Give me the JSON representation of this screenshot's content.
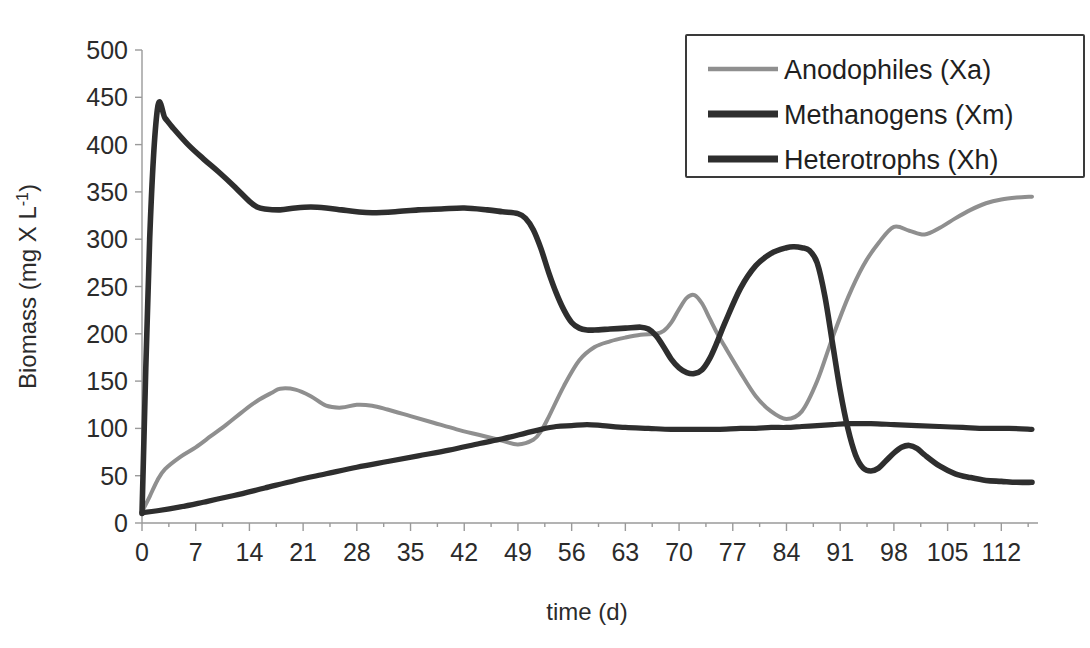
{
  "figure": {
    "top_cut_text": "",
    "background_color": "#ffffff"
  },
  "chart_data": {
    "type": "line",
    "title": "",
    "xlabel": "time (d)",
    "ylabel": "Biomass (mg X L-1)",
    "ylabel_parts": {
      "main": "Biomass (mg X L",
      "sup": "-1",
      "close": ")"
    },
    "xlim": [
      0,
      116
    ],
    "ylim": [
      0,
      500
    ],
    "xticks": [
      0,
      7,
      14,
      21,
      28,
      35,
      42,
      49,
      56,
      63,
      70,
      77,
      84,
      91,
      98,
      105,
      112
    ],
    "yticks": [
      0,
      50,
      100,
      150,
      200,
      250,
      300,
      350,
      400,
      450,
      500
    ],
    "grid": false,
    "legend_position": "top-right",
    "series": [
      {
        "name": "Anodophiles (Xa)",
        "key": "Xa",
        "color": "#8f8f8f",
        "width": 4.0,
        "x": [
          0,
          1,
          2,
          3,
          5,
          7,
          9,
          11,
          13,
          15,
          17,
          18,
          20,
          22,
          24,
          26,
          28,
          30,
          32,
          35,
          38,
          41,
          44,
          47,
          49,
          51,
          52,
          53,
          55,
          57,
          59,
          61,
          63,
          65,
          67,
          68,
          69,
          70,
          71,
          72,
          73,
          74,
          75,
          76,
          78,
          80,
          82,
          84,
          86,
          88,
          90,
          92,
          94,
          96,
          98,
          100,
          102,
          104,
          106,
          108,
          110,
          112,
          114,
          116
        ],
        "y": [
          12,
          28,
          45,
          57,
          70,
          80,
          92,
          104,
          117,
          129,
          138,
          142,
          141,
          134,
          124,
          122,
          125,
          124,
          120,
          113,
          106,
          99,
          93,
          87,
          83,
          88,
          97,
          112,
          145,
          172,
          186,
          192,
          196,
          199,
          200,
          203,
          212,
          226,
          238,
          241,
          232,
          216,
          200,
          186,
          159,
          134,
          118,
          110,
          118,
          150,
          196,
          238,
          272,
          296,
          313,
          309,
          305,
          312,
          322,
          331,
          338,
          342,
          344,
          345
        ]
      },
      {
        "name": "Methanogens (Xm)",
        "key": "Xm",
        "color": "#2e2e2e",
        "width": 5.6,
        "x": [
          0,
          1,
          2,
          3,
          4,
          6,
          8,
          10,
          12,
          14,
          15,
          16,
          18,
          20,
          22,
          24,
          26,
          28,
          30,
          33,
          36,
          39,
          42,
          45,
          47,
          49,
          50,
          51,
          52,
          53,
          54,
          55,
          56,
          57,
          58,
          59,
          61,
          63,
          65,
          66,
          67,
          68,
          69,
          70,
          71,
          72,
          73,
          74,
          75,
          76,
          78,
          80,
          82,
          84,
          85,
          86,
          87,
          88,
          89,
          90,
          91,
          92,
          93,
          94,
          95,
          96,
          97,
          98,
          99,
          100,
          101,
          102,
          104,
          106,
          108,
          110,
          112,
          114,
          116
        ],
        "y": [
          10,
          300,
          437,
          428,
          418,
          400,
          385,
          371,
          356,
          340,
          334,
          332,
          331,
          333,
          334,
          333,
          331,
          329,
          328,
          329,
          331,
          332,
          333,
          331,
          329,
          327,
          322,
          310,
          290,
          265,
          243,
          225,
          212,
          206,
          204,
          204,
          205,
          206,
          207,
          205,
          198,
          186,
          173,
          164,
          159,
          158,
          162,
          174,
          192,
          212,
          248,
          272,
          285,
          291,
          292,
          291,
          288,
          275,
          240,
          190,
          140,
          100,
          72,
          58,
          55,
          58,
          66,
          74,
          80,
          82,
          79,
          72,
          60,
          52,
          48,
          45,
          44,
          43,
          43
        ]
      },
      {
        "name": "Heterotrophs (Xh)",
        "key": "Xh",
        "color": "#2e2e2e",
        "width": 5.2,
        "x": [
          0,
          2,
          5,
          8,
          12,
          16,
          20,
          24,
          28,
          32,
          36,
          40,
          44,
          47,
          50,
          52,
          54,
          56,
          58,
          60,
          63,
          66,
          69,
          72,
          75,
          78,
          80,
          82,
          84,
          86,
          88,
          90,
          92,
          95,
          98,
          101,
          104,
          107,
          110,
          113,
          116
        ],
        "y": [
          11,
          13,
          17,
          22,
          29,
          37,
          45,
          52,
          59,
          65,
          71,
          77,
          84,
          89,
          95,
          99,
          102,
          103,
          104,
          103,
          101,
          100,
          99,
          99,
          99,
          100,
          100,
          101,
          101,
          102,
          103,
          104,
          105,
          105,
          104,
          103,
          102,
          101,
          100,
          100,
          99
        ]
      }
    ]
  },
  "legend": {
    "entries": [
      {
        "label": "Anodophiles (Xa)",
        "color": "#8f8f8f",
        "width": 4.5
      },
      {
        "label": "Methanogens (Xm)",
        "color": "#2e2e2e",
        "width": 7
      },
      {
        "label": "Heterotrophs (Xh)",
        "color": "#2e2e2e",
        "width": 7
      }
    ]
  }
}
